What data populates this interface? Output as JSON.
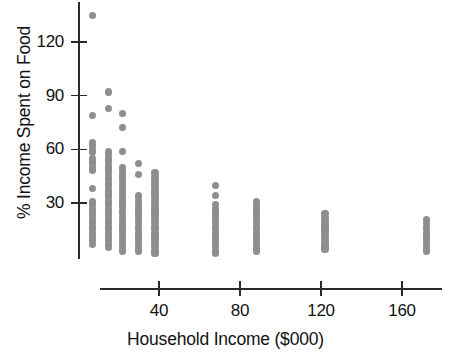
{
  "chart_data": {
    "type": "scatter",
    "title": "",
    "xlabel": "Household Income ($000)",
    "ylabel": "% Income Spent on Food",
    "grid": false,
    "legend": null,
    "xlim": [
      0,
      185
    ],
    "ylim": [
      0,
      140
    ],
    "xticks": [
      40,
      80,
      120,
      160
    ],
    "xtick_labels": [
      "40",
      "80",
      "120",
      "160"
    ],
    "yticks": [
      30,
      60,
      90,
      120
    ],
    "ytick_labels": [
      "30",
      "60",
      "90",
      "120"
    ],
    "marker_color": "#8e8e8e",
    "axis_color": "#2a2a2a",
    "columns": [
      {
        "x": 7,
        "y_values": [
          135,
          79,
          64,
          62,
          60,
          58,
          55,
          53,
          52,
          50,
          48,
          38,
          31,
          29,
          27,
          25,
          23,
          21,
          19,
          17,
          15,
          13,
          11,
          9,
          7
        ]
      },
      {
        "x": 15,
        "y_values": [
          92,
          83,
          59,
          57,
          55,
          53,
          51,
          49,
          47,
          45,
          43,
          41,
          39,
          37,
          35,
          33,
          31,
          29,
          27,
          25,
          23,
          21,
          19,
          17,
          15,
          13,
          11,
          9,
          7,
          5
        ]
      },
      {
        "x": 22,
        "y_values": [
          80,
          72,
          59,
          50,
          48,
          46,
          44,
          42,
          40,
          38,
          36,
          34,
          32,
          30,
          28,
          26,
          24,
          22,
          20,
          18,
          16,
          14,
          12,
          10,
          8,
          6,
          4,
          3
        ]
      },
      {
        "x": 30,
        "y_values": [
          52,
          46,
          34,
          33,
          31,
          29,
          27,
          25,
          23,
          21,
          19,
          17,
          15,
          13,
          11,
          9,
          7,
          5,
          4,
          3
        ]
      },
      {
        "x": 38,
        "y_values": [
          47,
          45,
          43,
          41,
          39,
          37,
          35,
          33,
          31,
          29,
          27,
          25,
          23,
          21,
          19,
          17,
          15,
          13,
          11,
          9,
          7,
          5,
          3,
          2
        ]
      },
      {
        "x": 68,
        "y_values": [
          40,
          34,
          29,
          27,
          25,
          23,
          21,
          19,
          17,
          15,
          13,
          11,
          9,
          7,
          5,
          3,
          2
        ]
      },
      {
        "x": 88,
        "y_values": [
          31,
          29,
          27,
          25,
          23,
          21,
          19,
          17,
          15,
          13,
          11,
          9,
          7,
          5,
          4,
          3
        ]
      },
      {
        "x": 122,
        "y_values": [
          24,
          22,
          20,
          18,
          16,
          14,
          12,
          10,
          8,
          6,
          5,
          4
        ]
      },
      {
        "x": 172,
        "y_values": [
          21,
          19,
          17,
          15,
          13,
          11,
          9,
          7,
          5,
          4,
          3
        ]
      }
    ]
  },
  "axis_titles": {
    "x": "Household Income ($000)",
    "y": "% Income Spent on Food"
  }
}
